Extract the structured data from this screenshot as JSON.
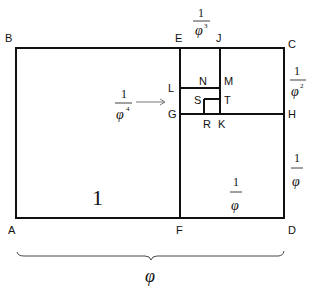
{
  "points": {
    "A": "A",
    "B": "B",
    "C": "C",
    "D": "D",
    "E": "E",
    "F": "F",
    "G": "G",
    "H": "H",
    "J": "J",
    "K": "K",
    "L": "L",
    "M": "M",
    "N": "N",
    "R": "R",
    "S": "S",
    "T": "T"
  },
  "labels": {
    "square_main": "1",
    "one": "1",
    "phi": "φ",
    "inv_phi_num": "1",
    "inv_phi_den": "φ",
    "inv_phi_right_num": "1",
    "inv_phi_right_den": "φ",
    "inv_phi2_num": "1",
    "inv_phi2_den": "φ",
    "inv_phi2_exp": "2",
    "inv_phi3_num": "1",
    "inv_phi3_den": "φ",
    "inv_phi3_exp": "3",
    "inv_phi4_num": "1",
    "inv_phi4_den": "φ",
    "inv_phi4_exp": "4",
    "bottom_width": "φ"
  },
  "colors": {
    "line": "#111111",
    "background": "#ffffff"
  }
}
